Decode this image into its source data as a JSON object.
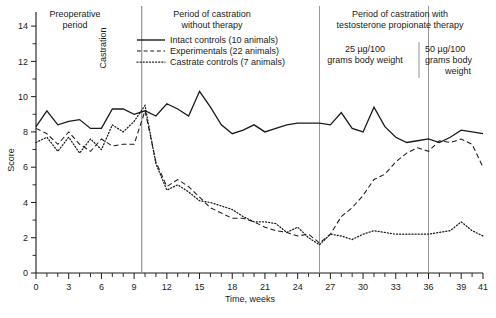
{
  "chart_data": {
    "type": "line",
    "title": "",
    "xlabel": "Time, weeks",
    "ylabel": "Score",
    "xlim": [
      0,
      41
    ],
    "ylim": [
      0,
      14.8
    ],
    "grid": false,
    "legend_position": "top-center",
    "xticks": [
      0,
      3,
      6,
      9,
      12,
      15,
      18,
      21,
      24,
      27,
      30,
      33,
      36,
      39,
      41
    ],
    "xtick_labels": [
      "0",
      "3",
      "6",
      "9",
      "12",
      "15",
      "18",
      "21",
      "24",
      "27",
      "30",
      "33",
      "36",
      "39",
      "41"
    ],
    "xminor_step": 1,
    "yticks": [
      0,
      2,
      4,
      6,
      8,
      10,
      12,
      14
    ],
    "ytick_labels": [
      "0",
      "2",
      "4",
      "6",
      "8",
      "10",
      "12",
      "14"
    ],
    "yminor": [
      1,
      3,
      5,
      7,
      9,
      11,
      13
    ],
    "series": [
      {
        "name": "Intact controls (10 animals)",
        "style": "solid",
        "x": [
          0,
          1,
          2,
          3,
          4,
          5,
          6,
          7,
          8,
          9,
          10,
          11,
          12,
          13,
          14,
          15,
          16,
          17,
          18,
          19,
          20,
          21,
          22,
          23,
          24,
          25,
          26,
          27,
          28,
          29,
          30,
          31,
          32,
          33,
          34,
          35,
          36,
          37,
          38,
          39,
          40,
          41
        ],
        "y": [
          8.3,
          9.2,
          8.4,
          8.6,
          8.7,
          8.2,
          8.2,
          9.3,
          9.3,
          9.0,
          9.2,
          8.9,
          9.6,
          9.3,
          8.9,
          10.3,
          9.4,
          8.4,
          7.9,
          8.1,
          8.4,
          8.0,
          8.2,
          8.4,
          8.5,
          8.5,
          8.5,
          8.4,
          9.1,
          8.2,
          8.0,
          9.4,
          8.3,
          7.7,
          7.4,
          7.5,
          7.6,
          7.4,
          7.7,
          8.1,
          8.0,
          7.9
        ]
      },
      {
        "name": "Experimentals (22 animals)",
        "style": "dashed",
        "x": [
          0,
          1,
          2,
          3,
          4,
          5,
          6,
          7,
          8,
          9,
          10,
          11,
          12,
          13,
          14,
          15,
          16,
          17,
          18,
          19,
          20,
          21,
          22,
          23,
          24,
          25,
          26,
          27,
          28,
          29,
          30,
          31,
          32,
          33,
          34,
          35,
          36,
          37,
          38,
          39,
          40,
          41
        ],
        "y": [
          8.2,
          7.9,
          7.3,
          8.0,
          7.3,
          6.9,
          7.6,
          7.2,
          7.3,
          7.3,
          9.2,
          6.3,
          4.9,
          5.3,
          4.9,
          4.3,
          3.7,
          3.4,
          3.1,
          3.1,
          2.9,
          2.6,
          2.4,
          2.3,
          2.1,
          2.2,
          1.7,
          2.2,
          3.2,
          3.7,
          4.4,
          5.3,
          5.6,
          6.3,
          6.8,
          7.1,
          6.9,
          7.5,
          7.4,
          7.6,
          7.3,
          6.0
        ]
      },
      {
        "name": "Castrate controls (7 animals)",
        "style": "dotted",
        "x": [
          0,
          1,
          2,
          3,
          4,
          5,
          6,
          7,
          8,
          9,
          10,
          11,
          12,
          13,
          14,
          15,
          16,
          17,
          18,
          19,
          20,
          21,
          22,
          23,
          24,
          25,
          26,
          27,
          28,
          29,
          30,
          31,
          32,
          33,
          34,
          35,
          36,
          37,
          38,
          39,
          40,
          41
        ],
        "y": [
          7.4,
          7.7,
          6.9,
          7.7,
          6.8,
          7.6,
          7.0,
          8.4,
          8.0,
          8.6,
          9.5,
          6.2,
          4.7,
          5.0,
          4.6,
          4.1,
          4.0,
          3.8,
          3.6,
          3.2,
          2.9,
          2.9,
          2.8,
          2.3,
          2.6,
          2.0,
          1.6,
          2.2,
          2.1,
          1.9,
          2.2,
          2.4,
          2.3,
          2.2,
          2.2,
          2.2,
          2.2,
          2.3,
          2.4,
          2.9,
          2.4,
          2.1
        ]
      }
    ],
    "annotations": [
      {
        "id": "preoperative",
        "text": "Preoperative\nperiod"
      },
      {
        "id": "castration",
        "text": "Castration",
        "rotated": true,
        "x": 9.7
      },
      {
        "id": "no-therapy",
        "text": "Period of castration\nwithout therapy"
      },
      {
        "id": "therapy",
        "text": "Period of castration with\ntestosterone propionate therapy"
      },
      {
        "id": "dose-25",
        "text": "25 µg/100\ngrams body weight"
      },
      {
        "id": "dose-50",
        "text": "50 µg/100\ngrams body\nweight"
      }
    ],
    "dividers": [
      9.7,
      26.0,
      36.0
    ]
  },
  "annotations": {
    "preoperative_l1": "Preoperative",
    "preoperative_l2": "period",
    "castration": "Castration",
    "no_therapy_l1": "Period of castration",
    "no_therapy_l2": "without therapy",
    "therapy_l1": "Period of castration with",
    "therapy_l2": "testosterone propionate therapy",
    "dose25_l1": "25 µg/100",
    "dose25_l2": "grams body weight",
    "dose50_l1": "50 µg/100",
    "dose50_l2": "grams body",
    "dose50_l3": "weight"
  },
  "axes": {
    "ylabel": "Score",
    "xlabel": "Time, weeks"
  },
  "legend": {
    "items": [
      {
        "label": "Intact controls (10 animals)",
        "style": "solid"
      },
      {
        "label": "Experimentals (22 animals)",
        "style": "dashed"
      },
      {
        "label": "Castrate controls (7 animals)",
        "style": "dotted"
      }
    ]
  },
  "xtick_labels": [
    "0",
    "3",
    "6",
    "9",
    "12",
    "15",
    "18",
    "21",
    "24",
    "27",
    "30",
    "33",
    "36",
    "39",
    "41"
  ],
  "ytick_labels": [
    "0",
    "2",
    "4",
    "6",
    "8",
    "10",
    "12",
    "14"
  ]
}
